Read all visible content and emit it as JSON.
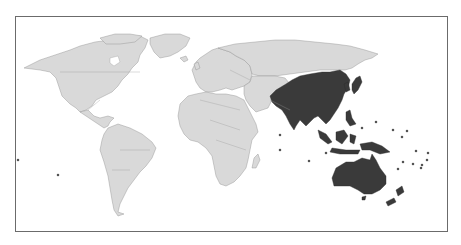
{
  "map": {
    "type": "world-choropleth",
    "projection": "equirectangular-like",
    "highlighted_region": "Asia-Pacific",
    "colors": {
      "background": "#ffffff",
      "frame": "#6b6b6b",
      "land": "#d9d9d9",
      "highlight": "#3a3a3a",
      "border": "#8a8a8a"
    },
    "highlighted_areas": [
      "South Asia",
      "China",
      "Mongolia",
      "Korea",
      "Japan",
      "Southeast Asia",
      "Indonesia",
      "Philippines",
      "Papua New Guinea",
      "Australia",
      "New Zealand",
      "Pacific Islands"
    ],
    "unhighlighted_areas": [
      "North America",
      "South America",
      "Europe",
      "Africa",
      "Middle East",
      "Russia",
      "Central Asia",
      "Greenland"
    ]
  }
}
